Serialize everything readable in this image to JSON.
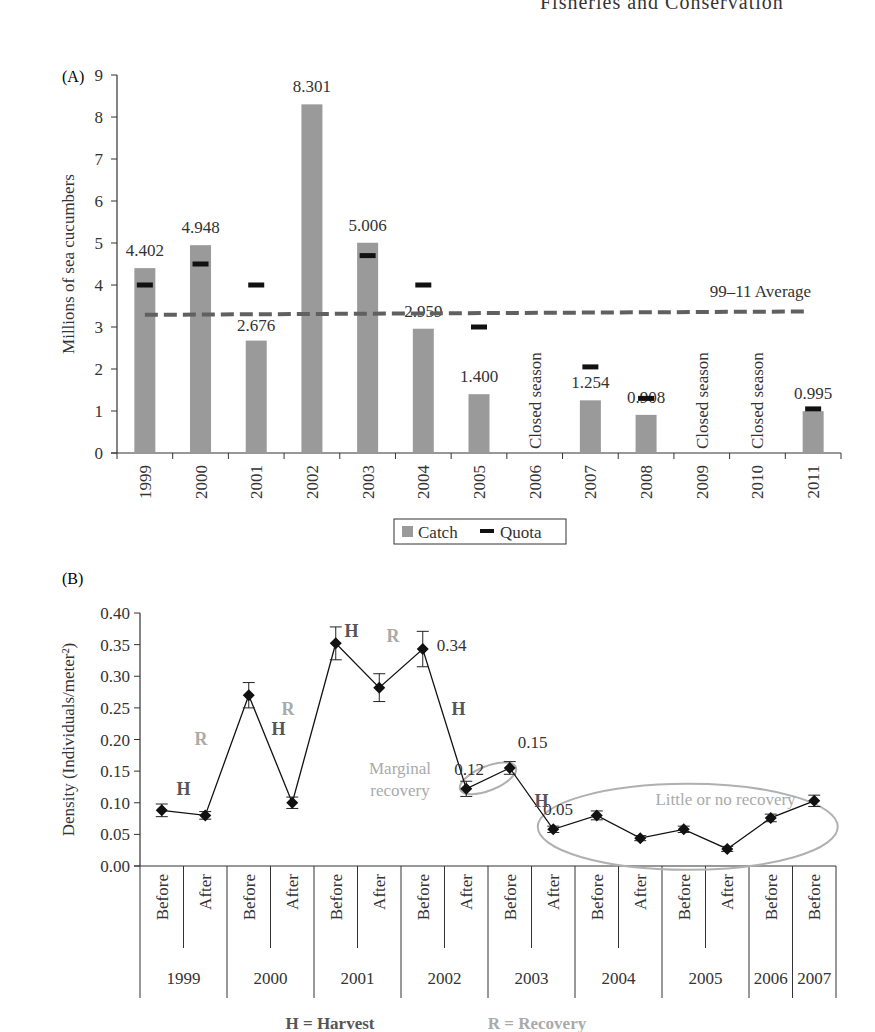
{
  "page_header": "Fisheries and Conservation",
  "chart_data": [
    {
      "panel": "(A)",
      "type": "bar",
      "ylabel": "Millions of sea cucumbers",
      "xlabel": "",
      "ylim": [
        0,
        9
      ],
      "yticks": [
        0,
        1,
        2,
        3,
        4,
        5,
        6,
        7,
        8,
        9
      ],
      "categories": [
        "1999",
        "2000",
        "2001",
        "2002",
        "2003",
        "2004",
        "2005",
        "2006",
        "2007",
        "2008",
        "2009",
        "2010",
        "2011"
      ],
      "series": [
        {
          "name": "Catch",
          "kind": "bar",
          "color": "#9a9a9a",
          "values": [
            4.402,
            4.948,
            2.676,
            8.301,
            5.006,
            2.959,
            1.4,
            null,
            1.254,
            0.908,
            null,
            null,
            0.995
          ]
        },
        {
          "name": "Quota",
          "kind": "marker",
          "color": "#111111",
          "values": [
            4.0,
            4.5,
            4.0,
            null,
            4.7,
            4.0,
            3.0,
            null,
            2.05,
            1.3,
            null,
            null,
            1.05
          ]
        }
      ],
      "data_labels": [
        "4.402",
        "4.948",
        "2.676",
        "8.301",
        "5.006",
        "2.959",
        "1.400",
        "",
        "1.254",
        "0.908",
        "",
        "",
        "0.995"
      ],
      "closed_season_label": "Closed season",
      "closed_seasons": [
        "2006",
        "2009",
        "2010"
      ],
      "average_line": {
        "label": "99–11 Average",
        "value": 3.3,
        "color": "#606060",
        "style": "dashed"
      },
      "legend": {
        "position": "bottom",
        "entries": [
          "Catch",
          "Quota"
        ]
      },
      "grid": false
    },
    {
      "panel": "(B)",
      "type": "line",
      "ylabel": "Density (Individuals/meter²)",
      "ylim": [
        0,
        0.4
      ],
      "yticks": [
        "0.00",
        "0.05",
        "0.10",
        "0.15",
        "0.20",
        "0.25",
        "0.30",
        "0.35",
        "0.40"
      ],
      "x": [
        "Before",
        "After",
        "Before",
        "After",
        "Before",
        "After",
        "Before",
        "After",
        "Before",
        "After",
        "Before",
        "After",
        "Before",
        "After",
        "Before",
        "Before"
      ],
      "year_groups": [
        {
          "year": "1999",
          "span": 2
        },
        {
          "year": "2000",
          "span": 2
        },
        {
          "year": "2001",
          "span": 2
        },
        {
          "year": "2002",
          "span": 2
        },
        {
          "year": "2003",
          "span": 2
        },
        {
          "year": "2004",
          "span": 2
        },
        {
          "year": "2005",
          "span": 2
        },
        {
          "year": "2006",
          "span": 1
        },
        {
          "year": "2007",
          "span": 1
        }
      ],
      "series": [
        {
          "name": "Density",
          "color": "#111111",
          "values": [
            0.088,
            0.08,
            0.27,
            0.1,
            0.352,
            0.282,
            0.343,
            0.122,
            0.155,
            0.058,
            0.08,
            0.044,
            0.058,
            0.027,
            0.076,
            0.103
          ],
          "error": [
            0.01,
            0.006,
            0.02,
            0.009,
            0.026,
            0.022,
            0.028,
            0.012,
            0.01,
            0.005,
            0.007,
            0.004,
            0.005,
            0.004,
            0.006,
            0.009
          ]
        }
      ],
      "value_labels": [
        {
          "index": 6,
          "text": "0.34"
        },
        {
          "index": 7,
          "text": "0.12"
        },
        {
          "index": 8,
          "text": "0.15"
        },
        {
          "index": 9,
          "text": "0.05"
        }
      ],
      "segment_labels": [
        {
          "between": [
            0,
            1
          ],
          "text": "H",
          "type": "harvest"
        },
        {
          "between": [
            1,
            2
          ],
          "text": "R",
          "type": "recovery"
        },
        {
          "between": [
            2,
            3
          ],
          "text": "H",
          "type": "harvest"
        },
        {
          "between": [
            3,
            4
          ],
          "text": "R",
          "type": "recovery"
        },
        {
          "between": [
            4,
            5
          ],
          "text": "H",
          "type": "harvest"
        },
        {
          "between": [
            5,
            6
          ],
          "text": "R",
          "type": "recovery"
        },
        {
          "between": [
            6,
            7
          ],
          "text": "H",
          "type": "harvest"
        },
        {
          "between": [
            8,
            9
          ],
          "text": "H",
          "type": "harvest"
        }
      ],
      "annotations": [
        {
          "text": "Marginal recovery",
          "line1": "Marginal",
          "line2": "recovery",
          "color": "#aaaaaa"
        },
        {
          "text": "Little or no recovery",
          "color": "#aaaaaa"
        }
      ],
      "legend": {
        "harvest": "H = Harvest",
        "recovery": "R = Recovery",
        "harvest_color": "#555555",
        "recovery_color": "#aaaaaa"
      },
      "grid": false
    }
  ]
}
